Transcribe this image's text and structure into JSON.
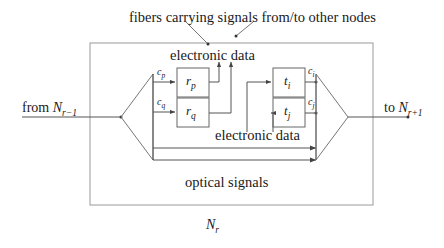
{
  "figure": {
    "type": "diagram",
    "node_label_base": "N",
    "node_label_sub": "r"
  },
  "annotations": {
    "top_caption": "fibers carrying signals from/to other nodes",
    "electronic_data_top": "electronic data",
    "electronic_data_mid": "electronic data",
    "optical_signals": "optical signals"
  },
  "ports": {
    "input_prefix": "from ",
    "input_base": "N",
    "input_sub": "r−1",
    "output_prefix": "to ",
    "output_base": "N",
    "output_sub": "r+1"
  },
  "boxes": [
    {
      "id": "rp",
      "base": "r",
      "sub": "p"
    },
    {
      "id": "rq",
      "base": "r",
      "sub": "q"
    },
    {
      "id": "ti",
      "base": "t",
      "sub": "i"
    },
    {
      "id": "tj",
      "base": "t",
      "sub": "j"
    }
  ],
  "channel_labels": [
    {
      "id": "cp",
      "base": "c",
      "sub": "p"
    },
    {
      "id": "cq",
      "base": "c",
      "sub": "q"
    },
    {
      "id": "ci",
      "base": "c",
      "sub": "i"
    },
    {
      "id": "cj",
      "base": "c",
      "sub": "j"
    }
  ],
  "colors": {
    "line": "#555555",
    "frame": "#999999",
    "box_border": "#666666",
    "text": "#1a1a1a",
    "background": "#ffffff"
  }
}
